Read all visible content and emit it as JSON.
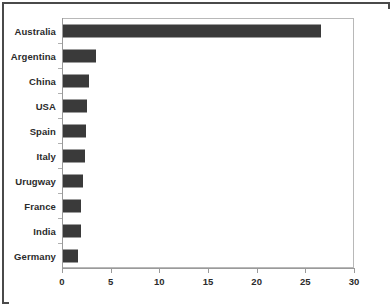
{
  "chart_data": {
    "type": "bar",
    "orientation": "horizontal",
    "title": "",
    "subtitle": "",
    "xlabel": "",
    "ylabel": "",
    "categories": [
      "Australia",
      "Argentina",
      "China",
      "USA",
      "Spain",
      "Italy",
      "Urugway",
      "France",
      "India",
      "Germany"
    ],
    "values": [
      26.5,
      3.4,
      2.7,
      2.5,
      2.4,
      2.3,
      2.1,
      1.9,
      1.8,
      1.5
    ],
    "series": [
      {
        "name": "",
        "values": [
          26.5,
          3.4,
          2.7,
          2.5,
          2.4,
          2.3,
          2.1,
          1.9,
          1.8,
          1.5
        ]
      }
    ],
    "xlim": [
      0,
      30
    ],
    "xticks": [
      0,
      5,
      10,
      15,
      20,
      25,
      30
    ],
    "xtick_labels": [
      "0",
      "5",
      "10",
      "15",
      "20",
      "25",
      "30"
    ],
    "grid": false,
    "legend": false,
    "legend_position": "none",
    "bar_color": "#3a3a3a",
    "axis_color": "#9a9a9a",
    "plot_border_color": "#b8b8b8",
    "frame_color": "#4a4a4a",
    "label_color": "#2b2b2b",
    "background": "#ffffff"
  }
}
